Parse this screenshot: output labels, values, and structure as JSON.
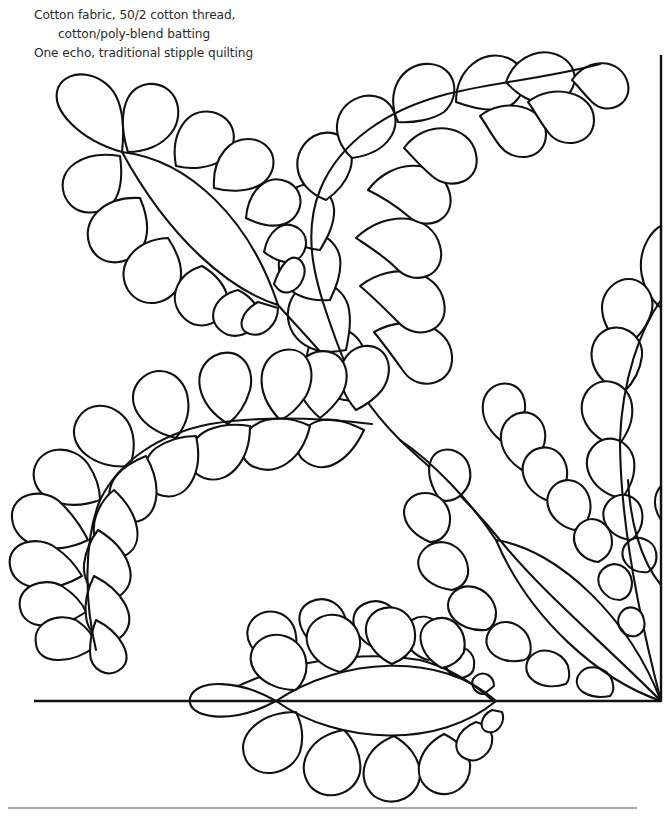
{
  "caption": {
    "line1": "Cotton fabric, 50/2 cotton thread,",
    "line2": "cotton/poly-blend batting",
    "line3": "One echo, traditional stipple quilting"
  },
  "colors": {
    "line": "#111111",
    "background": "#ffffff",
    "bottom_rule": "#8a8a8a",
    "caption_text": "#2a2a2a"
  },
  "frame": {
    "vertical_line": {
      "x": 661,
      "y1": 55,
      "y2": 701
    },
    "baseline": {
      "x1": 34,
      "x2": 661,
      "y": 701
    },
    "bottom_rule": {
      "x1": 8,
      "x2": 637,
      "y": 808
    }
  },
  "design": {
    "description": "Feather quilting motif with curved spines, teardrop plumes and three pointed leaf (almond) shapes",
    "leaves": [
      {
        "name": "upper-left-leaf",
        "tip_a": [
          122,
          152
        ],
        "tip_b": [
          278,
          305
        ]
      },
      {
        "name": "lower-right-leaf",
        "tip_a": [
          496,
          540
        ],
        "tip_b": [
          661,
          701
        ]
      },
      {
        "name": "bottom-center-leaf",
        "tip_a": [
          276,
          701
        ],
        "tip_b": [
          496,
          701
        ]
      }
    ],
    "feathers": [
      {
        "name": "main-rising-feather",
        "spine": [
          [
            661,
            701
          ],
          [
            520,
            560
          ],
          [
            400,
            450
          ],
          [
            320,
            340
          ],
          [
            300,
            260
          ],
          [
            330,
            170
          ],
          [
            420,
            110
          ],
          [
            520,
            85
          ],
          [
            600,
            70
          ]
        ]
      },
      {
        "name": "left-arc-feather",
        "spine": [
          [
            370,
            430
          ],
          [
            270,
            420
          ],
          [
            180,
            440
          ],
          [
            110,
            490
          ],
          [
            80,
            560
          ],
          [
            90,
            640
          ]
        ]
      },
      {
        "name": "right-edge-feather",
        "spine": [
          [
            661,
            700
          ],
          [
            640,
            620
          ],
          [
            620,
            520
          ],
          [
            615,
            420
          ],
          [
            640,
            300
          ],
          [
            661,
            250
          ]
        ]
      },
      {
        "name": "bottom-sprig",
        "spine": [
          [
            196,
            701
          ],
          [
            300,
            650
          ],
          [
            400,
            640
          ],
          [
            470,
            690
          ]
        ]
      }
    ]
  }
}
